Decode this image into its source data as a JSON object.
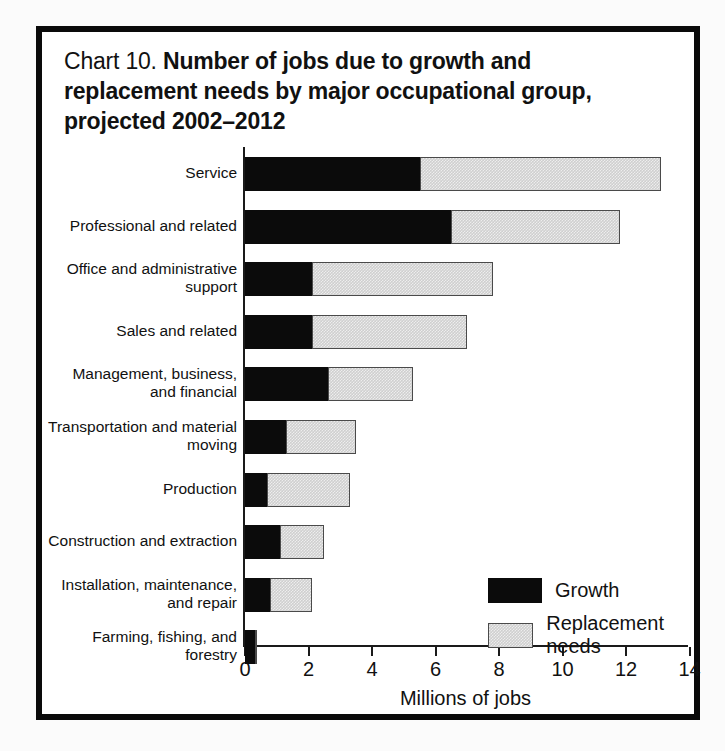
{
  "chart_data": {
    "type": "bar",
    "orientation": "horizontal",
    "stacked": true,
    "title_prefix": "Chart 10.",
    "title": "Number of jobs due to growth and replacement needs by major occupational group, projected 2002–2012",
    "title_lines": [
      "Number of jobs due to growth and",
      "replacement needs by major occupational group,",
      "projected 2002–2012"
    ],
    "xlabel": "Millions of jobs",
    "ylabel": "",
    "xlim": [
      0,
      14
    ],
    "xticks": [
      0,
      2,
      4,
      6,
      8,
      10,
      12,
      14
    ],
    "xticklabels": [
      "0",
      "2",
      "4",
      "6",
      "8",
      "10",
      "12",
      "14"
    ],
    "grid": false,
    "legend_position": "inside-right",
    "categories": [
      "Service",
      "Professional and related",
      "Office and administrative support",
      "Sales and related",
      "Management, business, and financial",
      "Transportation and material moving",
      "Production",
      "Construction and extraction",
      "Installation, maintenance, and repair",
      "Farming, fishing, and forestry"
    ],
    "category_label_lines": [
      [
        "Service"
      ],
      [
        "Professional and related"
      ],
      [
        "Office and administrative",
        "support"
      ],
      [
        "Sales and related"
      ],
      [
        "Management, business,",
        "and financial"
      ],
      [
        "Transportation and material",
        "moving"
      ],
      [
        "Production"
      ],
      [
        "Construction and extraction"
      ],
      [
        "Installation, maintenance,",
        "and repair"
      ],
      [
        "Farming, fishing, and",
        "forestry"
      ]
    ],
    "series": [
      {
        "name": "Growth",
        "color": "#0b0b0b",
        "values": [
          5.5,
          6.5,
          2.1,
          2.1,
          2.6,
          1.3,
          0.7,
          1.1,
          0.8,
          0.3
        ]
      },
      {
        "name": "Replacement needs",
        "color": "#cfcfcf",
        "values": [
          7.6,
          5.3,
          5.7,
          4.9,
          2.7,
          2.2,
          2.6,
          1.4,
          1.3,
          0.05
        ]
      }
    ],
    "totals": [
      13.1,
      11.8,
      7.8,
      7.0,
      5.3,
      3.5,
      3.3,
      2.5,
      2.1,
      0.35
    ]
  },
  "legend": {
    "items": [
      {
        "label": "Growth",
        "swatch": "black-filled"
      },
      {
        "label": "Replacement needs",
        "swatch": "gray-outlined"
      }
    ]
  }
}
